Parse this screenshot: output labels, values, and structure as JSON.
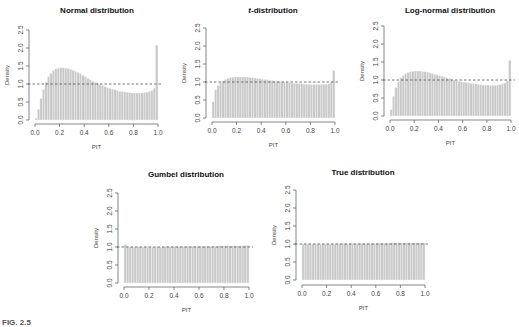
{
  "figure_label": "FIG. 2.5",
  "chart_data": [
    {
      "type": "bar",
      "title": "Normal distribution",
      "xlabel": "PIT",
      "ylabel": "Density",
      "ylim": [
        0,
        2.5
      ],
      "xlim": [
        0,
        1
      ],
      "xticks": [
        "0.0",
        "0.2",
        "0.4",
        "0.6",
        "0.8",
        "1.0"
      ],
      "yticks": [
        "0.0",
        "0.5",
        "1.0",
        "1.5",
        "2.0",
        "2.5"
      ],
      "reference_line": 1.0,
      "bins": 50,
      "values": [
        0.05,
        0.3,
        0.6,
        0.85,
        1.05,
        1.2,
        1.3,
        1.38,
        1.42,
        1.44,
        1.45,
        1.45,
        1.44,
        1.43,
        1.41,
        1.38,
        1.35,
        1.32,
        1.28,
        1.24,
        1.2,
        1.16,
        1.12,
        1.08,
        1.05,
        1.02,
        0.99,
        0.96,
        0.93,
        0.9,
        0.88,
        0.86,
        0.84,
        0.82,
        0.8,
        0.79,
        0.78,
        0.77,
        0.76,
        0.75,
        0.75,
        0.75,
        0.75,
        0.75,
        0.76,
        0.77,
        0.79,
        0.82,
        0.88,
        2.08
      ]
    },
    {
      "type": "bar",
      "title": "t-distribution",
      "xlabel": "PIT",
      "ylabel": "Density",
      "ylim": [
        0,
        2.5
      ],
      "xlim": [
        0,
        1
      ],
      "xticks": [
        "0.0",
        "0.2",
        "0.4",
        "0.6",
        "0.8",
        "1.0"
      ],
      "yticks": [
        "0.0",
        "0.5",
        "1.0",
        "1.5",
        "2.0",
        "2.5"
      ],
      "reference_line": 1.0,
      "bins": 50,
      "values": [
        0.45,
        0.78,
        0.9,
        0.98,
        1.03,
        1.07,
        1.1,
        1.12,
        1.13,
        1.14,
        1.14,
        1.14,
        1.14,
        1.14,
        1.14,
        1.13,
        1.12,
        1.11,
        1.1,
        1.09,
        1.08,
        1.07,
        1.06,
        1.05,
        1.04,
        1.03,
        1.02,
        1.01,
        1.0,
        1.0,
        0.99,
        0.98,
        0.97,
        0.96,
        0.96,
        0.95,
        0.95,
        0.94,
        0.94,
        0.93,
        0.93,
        0.93,
        0.93,
        0.93,
        0.93,
        0.94,
        0.94,
        0.95,
        1.0,
        1.32
      ]
    },
    {
      "type": "bar",
      "title": "Log-normal distribution",
      "xlabel": "PIT",
      "ylabel": "Density",
      "ylim": [
        0,
        2.5
      ],
      "xlim": [
        0,
        1
      ],
      "xticks": [
        "0.0",
        "0.2",
        "0.4",
        "0.6",
        "0.8",
        "1.0"
      ],
      "yticks": [
        "0.0",
        "0.5",
        "1.0",
        "1.5",
        "2.0",
        "2.5"
      ],
      "reference_line": 1.0,
      "bins": 50,
      "values": [
        0.18,
        0.55,
        0.78,
        0.95,
        1.06,
        1.13,
        1.18,
        1.21,
        1.23,
        1.24,
        1.25,
        1.25,
        1.25,
        1.24,
        1.23,
        1.22,
        1.2,
        1.18,
        1.16,
        1.14,
        1.12,
        1.1,
        1.08,
        1.06,
        1.04,
        1.02,
        1.0,
        0.98,
        0.96,
        0.95,
        0.94,
        0.93,
        0.92,
        0.91,
        0.9,
        0.89,
        0.88,
        0.87,
        0.86,
        0.86,
        0.86,
        0.85,
        0.85,
        0.85,
        0.86,
        0.87,
        0.89,
        0.92,
        0.98,
        1.55
      ]
    },
    {
      "type": "bar",
      "title": "Gumbel distribution",
      "xlabel": "PIT",
      "ylabel": "Density",
      "ylim": [
        0,
        2.5
      ],
      "xlim": [
        0,
        1
      ],
      "xticks": [
        "0.0",
        "0.2",
        "0.4",
        "0.6",
        "0.8",
        "1.0"
      ],
      "yticks": [
        "0.0",
        "0.5",
        "1.0",
        "1.5",
        "2.0",
        "2.5"
      ],
      "reference_line": 1.0,
      "bins": 50,
      "values": [
        1.07,
        1.0,
        1.0,
        1.0,
        1.0,
        1.0,
        1.0,
        1.0,
        1.0,
        1.0,
        1.0,
        1.0,
        1.0,
        1.0,
        1.0,
        1.0,
        1.01,
        1.01,
        1.01,
        1.01,
        1.01,
        1.01,
        1.01,
        1.01,
        1.01,
        1.01,
        1.01,
        1.02,
        1.02,
        1.02,
        1.02,
        1.02,
        1.02,
        1.02,
        1.02,
        1.02,
        1.02,
        1.02,
        1.03,
        1.03,
        1.03,
        1.03,
        1.03,
        1.03,
        1.03,
        1.03,
        1.03,
        1.04,
        1.04,
        1.05
      ]
    },
    {
      "type": "bar",
      "title": "True distribution",
      "xlabel": "PIT",
      "ylabel": "Density",
      "ylim": [
        0,
        2.5
      ],
      "xlim": [
        0,
        1
      ],
      "xticks": [
        "0.0",
        "0.2",
        "0.4",
        "0.6",
        "0.8",
        "1.0"
      ],
      "yticks": [
        "0.0",
        "0.5",
        "1.0",
        "1.5",
        "2.0",
        "2.5"
      ],
      "reference_line": 1.0,
      "bins": 50,
      "values": [
        1.0,
        1.0,
        1.0,
        1.0,
        1.0,
        1.0,
        1.0,
        1.0,
        1.0,
        1.0,
        1.0,
        1.0,
        1.0,
        1.0,
        1.0,
        1.01,
        1.01,
        1.01,
        1.01,
        1.01,
        1.01,
        1.01,
        1.01,
        1.01,
        1.01,
        1.01,
        1.01,
        1.01,
        1.02,
        1.02,
        1.02,
        1.02,
        1.02,
        1.02,
        1.02,
        1.02,
        1.03,
        1.03,
        1.03,
        1.03,
        1.03,
        1.03,
        1.03,
        1.03,
        1.03,
        1.03,
        1.03,
        1.03,
        1.03,
        1.03
      ]
    }
  ],
  "layout": {
    "bar_color": "#c9c9c9",
    "bar_edge": "#f2f2f2",
    "ref_line_color": "#555555",
    "axis_color": "#555555",
    "panels": [
      {
        "ax_x": 29,
        "x0": 35,
        "x1": 158,
        "y0": 120,
        "y25": 30,
        "xaxis_y": 124,
        "title_y": 13,
        "title_x": 97
      },
      {
        "ax_x": 206,
        "x0": 212,
        "x1": 335,
        "y0": 118,
        "y25": 28,
        "xaxis_y": 122,
        "title_y": 13,
        "title_x": 273
      },
      {
        "ax_x": 384,
        "x0": 390,
        "x1": 511,
        "y0": 116,
        "y25": 26,
        "xaxis_y": 120,
        "title_y": 13,
        "title_x": 450
      },
      {
        "ax_x": 118,
        "x0": 124,
        "x1": 249,
        "y0": 283,
        "y25": 193,
        "xaxis_y": 287,
        "title_y": 177,
        "title_x": 186
      },
      {
        "ax_x": 296,
        "x0": 302,
        "x1": 425,
        "y0": 280,
        "y25": 190,
        "xaxis_y": 285,
        "title_y": 175,
        "title_x": 363
      }
    ]
  }
}
